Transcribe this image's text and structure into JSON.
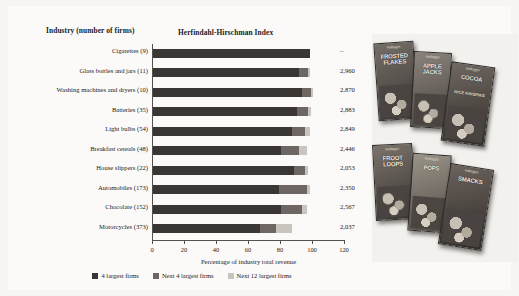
{
  "headers": {
    "industry": "Industry (number of firms)",
    "hhi": "Herfindahl-Hirschman Index"
  },
  "chart_data": {
    "type": "bar",
    "orientation": "horizontal",
    "stacked": true,
    "title": "Herfindahl-Hirschman Index",
    "xlabel": "Percentage of industry total revenue",
    "ylabel": "Industry (number of firms)",
    "xlim": [
      0,
      120
    ],
    "xticks": [
      0,
      20,
      40,
      60,
      80,
      100,
      120
    ],
    "grid": false,
    "legend_position": "bottom",
    "legend": [
      "4 largest firms",
      "Next 4 largest firms",
      "Next 12 largest firms"
    ],
    "value_column_header": "Herfindahl-Hirschman Index",
    "categories": [
      "Cigarettes (9)",
      "Glass bottles and jars (11)",
      "Washing machines and dryers (10)",
      "Batteries (35)",
      "Light bulbs (54)",
      "Breakfast cereals (48)",
      "House slippers (22)",
      "Automobiles (173)",
      "Chocolate (152)",
      "Motorcycles (373)"
    ],
    "series": [
      {
        "name": "4 largest firms",
        "color": "#3a3634",
        "values": [
          98,
          91,
          93,
          90,
          87,
          80,
          88,
          79,
          80,
          67
        ]
      },
      {
        "name": "Next 4 largest firms",
        "color": "#6d6663",
        "values": [
          0,
          6,
          6,
          7,
          8,
          11,
          7,
          17,
          13,
          10
        ]
      },
      {
        "name": "Next 12 largest firms",
        "color": "#c9c4bd",
        "values": [
          0,
          1,
          1,
          2,
          3,
          5,
          2,
          2,
          3,
          10
        ]
      }
    ],
    "hhi_values": [
      "–",
      "2,960",
      "2,870",
      "2,883",
      "2,849",
      "2,446",
      "2,053",
      "2,350",
      "2,567",
      "2,037"
    ]
  },
  "photo": {
    "caption": "",
    "boxes": [
      {
        "name": "frosted-flakes",
        "brand": "Kellogg's",
        "title": "FROSTED FLAKES",
        "sub": ""
      },
      {
        "name": "apple-jacks",
        "brand": "Kellogg's",
        "title": "APPLE JACKS",
        "sub": ""
      },
      {
        "name": "cocoa-rice-krispies",
        "brand": "Kellogg's",
        "title": "COCOA",
        "sub": "RICE KRISPIES"
      },
      {
        "name": "froot-loops",
        "brand": "Kellogg's",
        "title": "FROOT LOOPS",
        "sub": ""
      },
      {
        "name": "corn-pops",
        "brand": "Kellogg's",
        "title": "POPS",
        "sub": ""
      },
      {
        "name": "smacks",
        "brand": "Kellogg's",
        "title": "SMACKS",
        "sub": ""
      }
    ]
  }
}
